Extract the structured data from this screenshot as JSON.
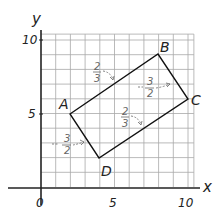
{
  "axes": {
    "x_label": "x",
    "y_label": "y",
    "x_ticks": [
      "0",
      "5",
      "10"
    ],
    "y_ticks": [
      "5",
      "10"
    ],
    "grid_range": {
      "x": [
        0,
        10.5
      ],
      "y": [
        0,
        10.5
      ]
    }
  },
  "shape": {
    "type": "rectangle",
    "vertices": [
      {
        "label": "A",
        "x": 2,
        "y": 5
      },
      {
        "label": "B",
        "x": 8,
        "y": 9
      },
      {
        "label": "C",
        "x": 10,
        "y": 6
      },
      {
        "label": "D",
        "x": 4,
        "y": 2
      }
    ]
  },
  "slope_annotations": [
    {
      "side": "AB",
      "num": "2",
      "den": "3",
      "sign": ""
    },
    {
      "side": "BC",
      "num": "3",
      "den": "2",
      "sign": "−"
    },
    {
      "side": "DC",
      "num": "2",
      "den": "3",
      "sign": ""
    },
    {
      "side": "AD",
      "num": "3",
      "den": "2",
      "sign": "−"
    }
  ],
  "colors": {
    "grid": "#9a9a9a",
    "axis": "#222222",
    "shape": "#111111",
    "annotation": "#666666"
  }
}
